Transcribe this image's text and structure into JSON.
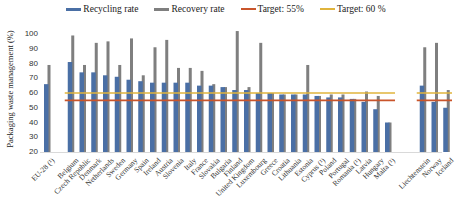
{
  "legend": {
    "recycling": "Recycling rate",
    "recovery": "Recovery rate",
    "target55": "Target: 55%",
    "target60": "Target: 60 %"
  },
  "colors": {
    "recycling": "#4a6fa5",
    "recovery": "#7f7f7f",
    "target55": "#c9552b",
    "target60": "#e0b43c",
    "axis": "#d9d9d9"
  },
  "chart_data": {
    "type": "bar",
    "title": "",
    "xlabel": "",
    "ylabel": "Packaging waste management (%)",
    "ylim": [
      20,
      100
    ],
    "yticks": [
      20,
      30,
      40,
      50,
      60,
      70,
      80,
      90,
      100
    ],
    "grid": false,
    "legend_position": "top",
    "categories": [
      "EU-28 (¹)",
      "Belgium",
      "Czech Republic",
      "Denmark",
      "Netherlands",
      "Sweden",
      "Germany",
      "Spain",
      "Ireland",
      "Austria",
      "Slovenia",
      "Italy",
      "France",
      "Slovakia",
      "Bulgaria",
      "Finland",
      "United Kingdom",
      "Luxembourg",
      "Greece",
      "Croatia",
      "Lithuania",
      "Estonia",
      "Cyprus (¹)",
      "Poland",
      "Portugal",
      "Romania (¹)",
      "Latvia",
      "Hungary",
      "Malta (¹)",
      "Liechtenstein",
      "Norway",
      "Iceland"
    ],
    "series": [
      {
        "name": "Recycling rate",
        "values": [
          66,
          81,
          74,
          74,
          72,
          71,
          69,
          68,
          67,
          67,
          67,
          67,
          65,
          65,
          64,
          62,
          62,
          60,
          60,
          59,
          59,
          59,
          58,
          57,
          57,
          56,
          54,
          49,
          40,
          65,
          54,
          50
        ]
      },
      {
        "name": "Recovery rate",
        "values": [
          79,
          99,
          79,
          94,
          95,
          79,
          97,
          72,
          91,
          96,
          77,
          77,
          75,
          66,
          64,
          102,
          64,
          94,
          60,
          59,
          59,
          79,
          58,
          59,
          59,
          56,
          61,
          58,
          40,
          91,
          94,
          62
        ]
      },
      {
        "name": "Target: 55%",
        "type": "line",
        "value": 55
      },
      {
        "name": "Target: 60 %",
        "type": "line",
        "value": 60
      }
    ],
    "category_gaps_after": [
      "EU-28 (¹)",
      "Malta (¹)"
    ]
  }
}
